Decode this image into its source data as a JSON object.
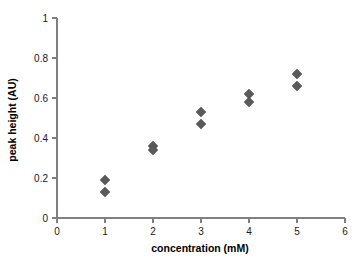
{
  "chart_data": {
    "type": "scatter",
    "title": "",
    "xlabel": "concentration (mM)",
    "ylabel": "peak height (AU)",
    "xlim": [
      0,
      6
    ],
    "ylim": [
      0,
      1
    ],
    "xticks": [
      "0",
      "1",
      "2",
      "3",
      "4",
      "5",
      "6"
    ],
    "yticks": [
      "0",
      "0.2",
      "0.4",
      "0.6",
      "0.8",
      "1"
    ],
    "xtick_values": [
      0,
      1,
      2,
      3,
      4,
      5,
      6
    ],
    "ytick_values": [
      0,
      0.2,
      0.4,
      0.6,
      0.8,
      1
    ],
    "grid": false,
    "legend": false,
    "marker": "diamond",
    "marker_color": "#5a5a5a",
    "axis_color": "#808080",
    "background_color": "#ffffff",
    "series": [
      {
        "name": "peak height",
        "points": [
          {
            "x": 1,
            "y": 0.19
          },
          {
            "x": 1,
            "y": 0.13
          },
          {
            "x": 2,
            "y": 0.36
          },
          {
            "x": 2,
            "y": 0.34
          },
          {
            "x": 3,
            "y": 0.53
          },
          {
            "x": 3,
            "y": 0.47
          },
          {
            "x": 4,
            "y": 0.62
          },
          {
            "x": 4,
            "y": 0.58
          },
          {
            "x": 5,
            "y": 0.72
          },
          {
            "x": 5,
            "y": 0.66
          }
        ]
      }
    ]
  }
}
